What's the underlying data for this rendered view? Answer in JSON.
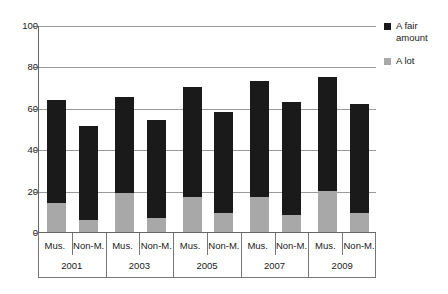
{
  "chart_data": {
    "type": "bar",
    "subtype": "stacked-bar-grouped",
    "title": "",
    "subtitle": "",
    "xlabel": "",
    "ylabel": "",
    "ylim": [
      0,
      100
    ],
    "yticks": [
      0,
      20,
      40,
      60,
      80,
      100
    ],
    "ytick_labels": [
      "0",
      "20",
      "40",
      "60",
      "80",
      "100"
    ],
    "grid": "horizontal",
    "legend_position": "right",
    "categories": [
      "Mus. 2001",
      "Non-M. 2001",
      "Mus. 2003",
      "Non-M. 2003",
      "Mus. 2005",
      "Non-M. 2005",
      "Mus. 2007",
      "Non-M. 2007",
      "Mus. 2009",
      "Non-M. 2009"
    ],
    "group_labels": [
      "2001",
      "2003",
      "2005",
      "2007",
      "2009"
    ],
    "category_labels": [
      "Mus.",
      "Non-M.",
      "Mus.",
      "Non-M.",
      "Mus.",
      "Non-M.",
      "Mus.",
      "Non-M.",
      "Mus.",
      "Non-M."
    ],
    "series": [
      {
        "name": "A lot",
        "color": "#a8a8a8",
        "values": [
          14,
          6,
          19,
          7,
          17,
          9,
          17,
          8,
          20,
          9
        ]
      },
      {
        "name": "A fair amount",
        "color": "#1a1a1a",
        "values": [
          50,
          45,
          46,
          47,
          53,
          49,
          56,
          55,
          55,
          53
        ]
      }
    ],
    "totals": [
      64,
      51,
      65,
      54,
      70,
      58,
      73,
      63,
      75,
      62
    ]
  },
  "legend": {
    "items": [
      {
        "label": "A fair amount",
        "color": "#1a1a1a",
        "swatch": "black-square-icon"
      },
      {
        "label": "A lot",
        "color": "#a8a8a8",
        "swatch": "gray-square-icon"
      }
    ]
  }
}
